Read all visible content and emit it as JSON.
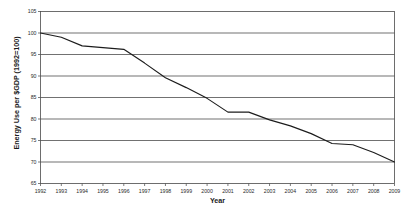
{
  "chart_data": {
    "type": "line",
    "title": "",
    "xlabel": "Year",
    "ylabel": "Energy Use per $GDP (1992=100)",
    "xlim": [
      1992,
      2009
    ],
    "ylim": [
      65,
      105
    ],
    "yticks": [
      65,
      70,
      75,
      80,
      85,
      90,
      95,
      100,
      105
    ],
    "grid": true,
    "grid_axis": "y",
    "legend": false,
    "legend_position": "none",
    "line_color": "#1c1c1c",
    "background_color": "#ffffff",
    "categories": [
      "1992",
      "1993",
      "1994",
      "1995",
      "1996",
      "1997",
      "1998",
      "1999",
      "2000",
      "2001",
      "2002",
      "2003",
      "2004",
      "2005",
      "2006",
      "2007",
      "2008",
      "2009"
    ],
    "series": [
      {
        "name": "Energy Use per $GDP",
        "values": [
          100.0,
          99.0,
          97.0,
          96.6,
          96.2,
          93.0,
          89.6,
          87.3,
          84.8,
          81.6,
          81.6,
          79.8,
          78.4,
          76.6,
          74.3,
          74.0,
          72.2,
          70.0
        ]
      }
    ]
  },
  "axes": {
    "y_title": "Energy Use per $GDP (1992=100)",
    "x_title": "Year"
  }
}
